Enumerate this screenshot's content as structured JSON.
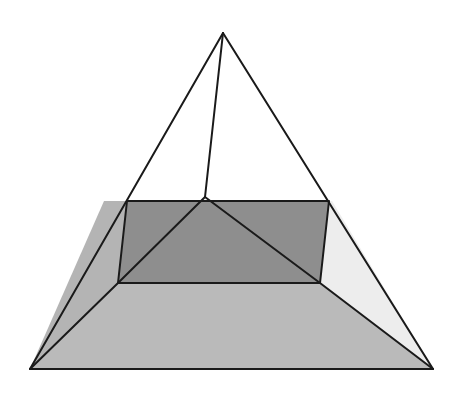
{
  "diagram": {
    "vertices": {
      "apex": [
        223,
        33
      ],
      "base_left": [
        30,
        369
      ],
      "base_right": [
        433,
        369
      ],
      "rect_back_left": [
        127,
        201
      ],
      "rect_back_right": [
        329,
        201
      ],
      "rect_front_left": [
        118,
        283
      ],
      "rect_front_right": [
        320,
        283
      ],
      "inner_apex": [
        205,
        197
      ]
    },
    "colors": {
      "stroke": "#1a1a1a",
      "rect_fill": "#8e8e8e",
      "left_face_fill": "#b4b4b4",
      "bottom_face_fill": "#bababa",
      "right_face_fill": "#ededed",
      "background": "#ffffff"
    }
  }
}
